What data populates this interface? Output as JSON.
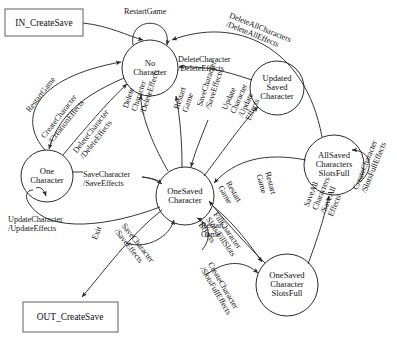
{
  "diagram": {
    "type": "state-machine",
    "stroke_color": "#2b2b2b",
    "text_color": "#141414",
    "background": "#ffffff",
    "terminals": [
      {
        "id": "in",
        "label": "IN_CreateSave",
        "x": 44,
        "y": 22,
        "w": 78,
        "h": 27
      },
      {
        "id": "out",
        "label": "OUT_CreateSave",
        "x": 70,
        "y": 317,
        "w": 95,
        "h": 30
      }
    ],
    "states": [
      {
        "id": "no_character",
        "label": "No\nCharacter",
        "x": 150,
        "y": 68,
        "r": 28
      },
      {
        "id": "one_character",
        "label": "One\nCharacter",
        "x": 47,
        "y": 176,
        "r": 26
      },
      {
        "id": "one_saved",
        "label": "OneSaved\nCharacter",
        "x": 185,
        "y": 196,
        "r": 29
      },
      {
        "id": "updated_saved",
        "label": "Updated\nSaved\nCharacter",
        "x": 277,
        "y": 88,
        "r": 27
      },
      {
        "id": "all_saved_full",
        "label": "AllSaved\nCharacters\nSlotsFull",
        "x": 334,
        "y": 165,
        "r": 30
      },
      {
        "id": "one_saved_full",
        "label": "OneSaved\nCharacter\nSlotsFull",
        "x": 287,
        "y": 285,
        "r": 31
      }
    ],
    "transitions": [
      {
        "id": "t_in",
        "label": "",
        "from": "in",
        "to": "no_character"
      },
      {
        "id": "t_restart_self",
        "label": "RestartGame",
        "from": "no_character",
        "to": "no_character",
        "x": 124,
        "y": 8,
        "rot": 0
      },
      {
        "id": "t_restart_one",
        "label": "RestartGame",
        "from": "one_character",
        "to": "no_character",
        "x": 25,
        "y": 109,
        "rot": -52
      },
      {
        "id": "t_create",
        "label": "CreateCharacter\n/CreationEffects",
        "from": "no_character",
        "to": "one_character",
        "x": 40,
        "y": 135,
        "rot": -52
      },
      {
        "id": "t_delete_one",
        "label": "DeleteCharacter\n/DeleteEffects",
        "from": "one_character",
        "to": "no_character",
        "x": 72,
        "y": 150,
        "rot": -52
      },
      {
        "id": "t_delete_all",
        "label": "DeleteAllCharacters\n/DeleteAllEffects",
        "from": "all_saved_full",
        "to": "no_character",
        "x": 231,
        "y": 12,
        "rot": 22
      },
      {
        "id": "t_delete_upd",
        "label": "DeleteCharacter\n/DeleteEffects",
        "from": "updated_saved",
        "to": "no_character",
        "x": 178,
        "y": 56,
        "rot": 0
      },
      {
        "id": "t_delete_saved",
        "label": "Delete\nCharacter\n/DeleteEffects",
        "from": "one_saved",
        "to": "no_character",
        "x": 122,
        "y": 107,
        "rot": -72
      },
      {
        "id": "t_restart_saved",
        "label": "Restart\nGame",
        "from": "one_saved",
        "to": "no_character",
        "x": 173,
        "y": 108,
        "rot": -72
      },
      {
        "id": "t_save_char",
        "label": "SaveCharacter\n/SaveEffects",
        "from": "one_character",
        "to": "one_saved",
        "x": 83,
        "y": 171,
        "rot": 0
      },
      {
        "id": "t_save_char2",
        "label": "SaveCharacter\n/SaveEffects",
        "from": "one_character",
        "to": "one_saved",
        "x": 196,
        "y": 105,
        "rot": -72
      },
      {
        "id": "t_update",
        "label": "Update\nCharacter\n/Update\nEffects",
        "from": "one_saved",
        "to": "updated_saved",
        "x": 221,
        "y": 108,
        "rot": -66
      },
      {
        "id": "t_update_one",
        "label": "UpdateCharacter\n/UpdateEffects",
        "from": "one_saved",
        "to": "one_character",
        "x": 8,
        "y": 216,
        "rot": 0
      },
      {
        "id": "t_exit",
        "label": "Exit",
        "from": "one_saved",
        "to": "out",
        "x": 91,
        "y": 238,
        "rot": -68
      },
      {
        "id": "t_save_self",
        "label": "SaveCharacter\n/SaveEffects",
        "from": "one_saved",
        "to": "one_saved",
        "x": 126,
        "y": 222,
        "rot": 52
      },
      {
        "id": "t_restart_self2",
        "label": "Restart\nGame",
        "from": "one_saved",
        "to": "one_saved",
        "x": 201,
        "y": 222,
        "rot": 0
      },
      {
        "id": "t_restart_allfull",
        "label": "Restart\nGame",
        "from": "all_saved_full",
        "to": "one_saved",
        "x": 271,
        "y": 171,
        "rot": 75
      },
      {
        "id": "t_restart_onefull",
        "label": "Restart\nGame",
        "from": "one_saved_full",
        "to": "one_saved",
        "x": 231,
        "y": 180,
        "rot": 60
      },
      {
        "id": "t_fill",
        "label": "FillCharacter\nSlots/FillSlots\nEffects",
        "from": "one_saved",
        "to": "one_saved_full",
        "x": 218,
        "y": 211,
        "rot": 55
      },
      {
        "id": "t_save_all",
        "label": "SaveAll\nCharacters\n/SaveAll\nEffects",
        "from": "one_saved_full",
        "to": "all_saved_full",
        "x": 303,
        "y": 205,
        "rot": -68
      },
      {
        "id": "t_create_full",
        "label": "CreateCharacter\n/SlotsFullEffects",
        "from": "all_saved_full",
        "to": "all_saved_full",
        "x": 352,
        "y": 188,
        "rot": -68
      },
      {
        "id": "t_create_full2",
        "label": "CreateCharacter\n/SlotsFullEffects",
        "from": "one_saved_full",
        "to": "one_saved_full",
        "x": 213,
        "y": 261,
        "rot": 60
      }
    ]
  }
}
